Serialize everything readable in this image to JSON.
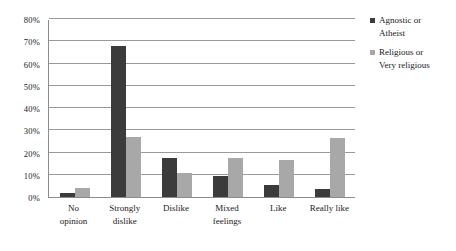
{
  "chart_data": {
    "type": "bar",
    "title": "",
    "xlabel": "",
    "ylabel": "",
    "ylim": [
      0,
      80
    ],
    "y_tick_labels": [
      "80%",
      "70%",
      "60%",
      "50%",
      "40%",
      "30%",
      "20%",
      "10%",
      "0%"
    ],
    "y_tick_values": [
      80,
      70,
      60,
      50,
      40,
      30,
      20,
      10,
      0
    ],
    "grid": "horizontal",
    "legend_position": "right",
    "categories": [
      "No opinion",
      "Strongly dislike",
      "Dislike",
      "Mixed feelings",
      "Like",
      "Really like"
    ],
    "category_lines": [
      [
        "No",
        "opinion"
      ],
      [
        "Strongly",
        "dislike"
      ],
      [
        "Dislike"
      ],
      [
        "Mixed",
        "feelings"
      ],
      [
        "Like"
      ],
      [
        "Really like"
      ]
    ],
    "series": [
      {
        "name": "Agnostic or Atheist",
        "name_lines": [
          "Agnostic or",
          "Atheist"
        ],
        "color": "#3b3b3b",
        "values": [
          2,
          68,
          17.5,
          9.5,
          5.5,
          3.5
        ]
      },
      {
        "name": "Religious or Very religious",
        "name_lines": [
          "Religious or",
          "Very religious"
        ],
        "color": "#a8a8a8",
        "values": [
          4,
          27,
          11,
          17.5,
          16.5,
          26.5
        ]
      }
    ]
  }
}
